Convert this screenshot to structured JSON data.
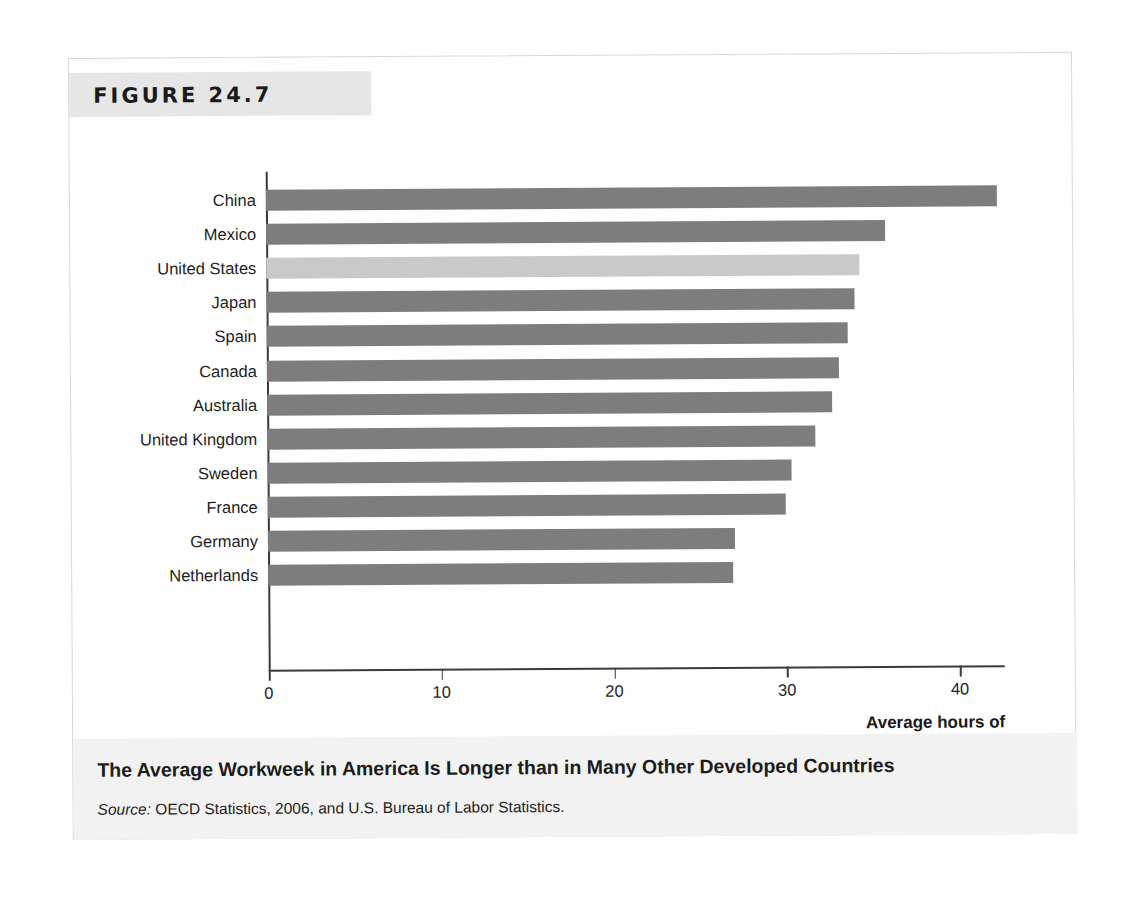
{
  "figure": {
    "number_label": "FIGURE 24.7",
    "caption": "The Average Workweek in America Is Longer than in Many Other Developed Countries",
    "source_prefix": "Source:",
    "source_text": " OECD Statistics, 2006, and U.S. Bureau of Labor Statistics."
  },
  "colors": {
    "bar": "#7d7d7d",
    "bar_highlight": "#c9c9c9",
    "band": "#e6e6e6",
    "footer": "#f2f2f2",
    "axis": "#3a3a3a"
  },
  "chart_data": {
    "type": "bar",
    "orientation": "horizontal",
    "title": "The Average Workweek in America Is Longer than in Many Other Developed Countries",
    "xlabel": "Average hours of work per week",
    "ylabel": "",
    "xlim": [
      0,
      42.5
    ],
    "xticks": [
      0,
      10,
      20,
      30,
      40
    ],
    "xtick_labels": [
      "0",
      "10",
      "20",
      "30",
      "40"
    ],
    "grid": false,
    "legend": false,
    "highlight_category": "United States",
    "categories": [
      "China",
      "Mexico",
      "United States",
      "Japan",
      "Spain",
      "Canada",
      "Australia",
      "United Kingdom",
      "Sweden",
      "France",
      "Germany",
      "Netherlands"
    ],
    "values": [
      42.3,
      35.8,
      34.3,
      34.0,
      33.6,
      33.1,
      32.7,
      31.7,
      30.3,
      30.0,
      27.0,
      26.9
    ]
  },
  "axis_label": {
    "line1": "Average hours of",
    "line2": "work per week"
  }
}
